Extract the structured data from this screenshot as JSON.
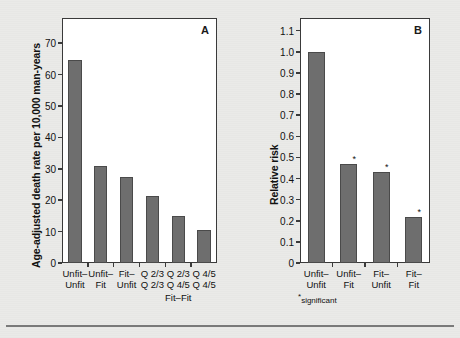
{
  "figure": {
    "background_color": "#eaeae8",
    "bar_color": "#6e6e6e",
    "axis_color": "#3a3a3a"
  },
  "chart_data": [
    {
      "type": "bar",
      "panel": "A",
      "title": "",
      "xlabel": "",
      "ylabel": "Age-adjusted death rate per 10,000 man-years",
      "ylim": [
        0,
        78
      ],
      "yticks": [
        0,
        10,
        20,
        30,
        40,
        50,
        60,
        70
      ],
      "ytick_labels": [
        "0",
        "10",
        "20",
        "30",
        "40",
        "50",
        "60",
        "70"
      ],
      "grid": false,
      "legend": "none",
      "categories": [
        "Unfit–\nUnfit",
        "Unfit–\nFit",
        "Fit–\nUnfit",
        "Q 2/3\nQ 2/3",
        "Q 2/3\nQ 4/5",
        "Q 4/5\nQ 4/5"
      ],
      "category_lines": [
        [
          "Unfit–",
          "Unfit"
        ],
        [
          "Unfit–",
          "Fit"
        ],
        [
          "Fit–",
          "Unfit"
        ],
        [
          "Q 2/3",
          "Q 2/3"
        ],
        [
          "Q 2/3",
          "Q 4/5"
        ],
        [
          "Q 4/5",
          "Q 4/5"
        ]
      ],
      "group_label": "Fit–Fit",
      "group_label_spans": [
        3,
        4,
        5
      ],
      "values": [
        64.5,
        31.0,
        27.5,
        21.3,
        15.0,
        10.5
      ]
    },
    {
      "type": "bar",
      "panel": "B",
      "title": "",
      "xlabel": "",
      "ylabel": "Relative risk",
      "ylim": [
        0,
        1.16
      ],
      "yticks": [
        0,
        0.1,
        0.2,
        0.3,
        0.4,
        0.5,
        0.6,
        0.7,
        0.8,
        0.9,
        1.0,
        1.1
      ],
      "ytick_labels": [
        "0",
        "0.1",
        "0.2",
        "0.3",
        "0.4",
        "0.5",
        "0.6",
        "0.7",
        "0.8",
        "0.9",
        "1.0",
        "1.1"
      ],
      "grid": false,
      "legend": "none",
      "categories": [
        "Unfit–\nUnfit",
        "Unfit–\nFit",
        "Fit–\nUnfit",
        "Fit–\nFit"
      ],
      "category_lines": [
        [
          "Unfit–",
          "Unfit"
        ],
        [
          "Unfit–",
          "Fit"
        ],
        [
          "Fit–",
          "Unfit"
        ],
        [
          "Fit–",
          "Fit"
        ]
      ],
      "values": [
        1.0,
        0.47,
        0.43,
        0.22
      ],
      "annotations": [
        {
          "category_index": 1,
          "marker": "*"
        },
        {
          "category_index": 2,
          "marker": "*"
        },
        {
          "category_index": 3,
          "marker": "*"
        }
      ],
      "footnote": "significant",
      "footnote_marker": "*"
    }
  ],
  "panels": {
    "a": {
      "letter": "A"
    },
    "b": {
      "letter": "B"
    }
  }
}
